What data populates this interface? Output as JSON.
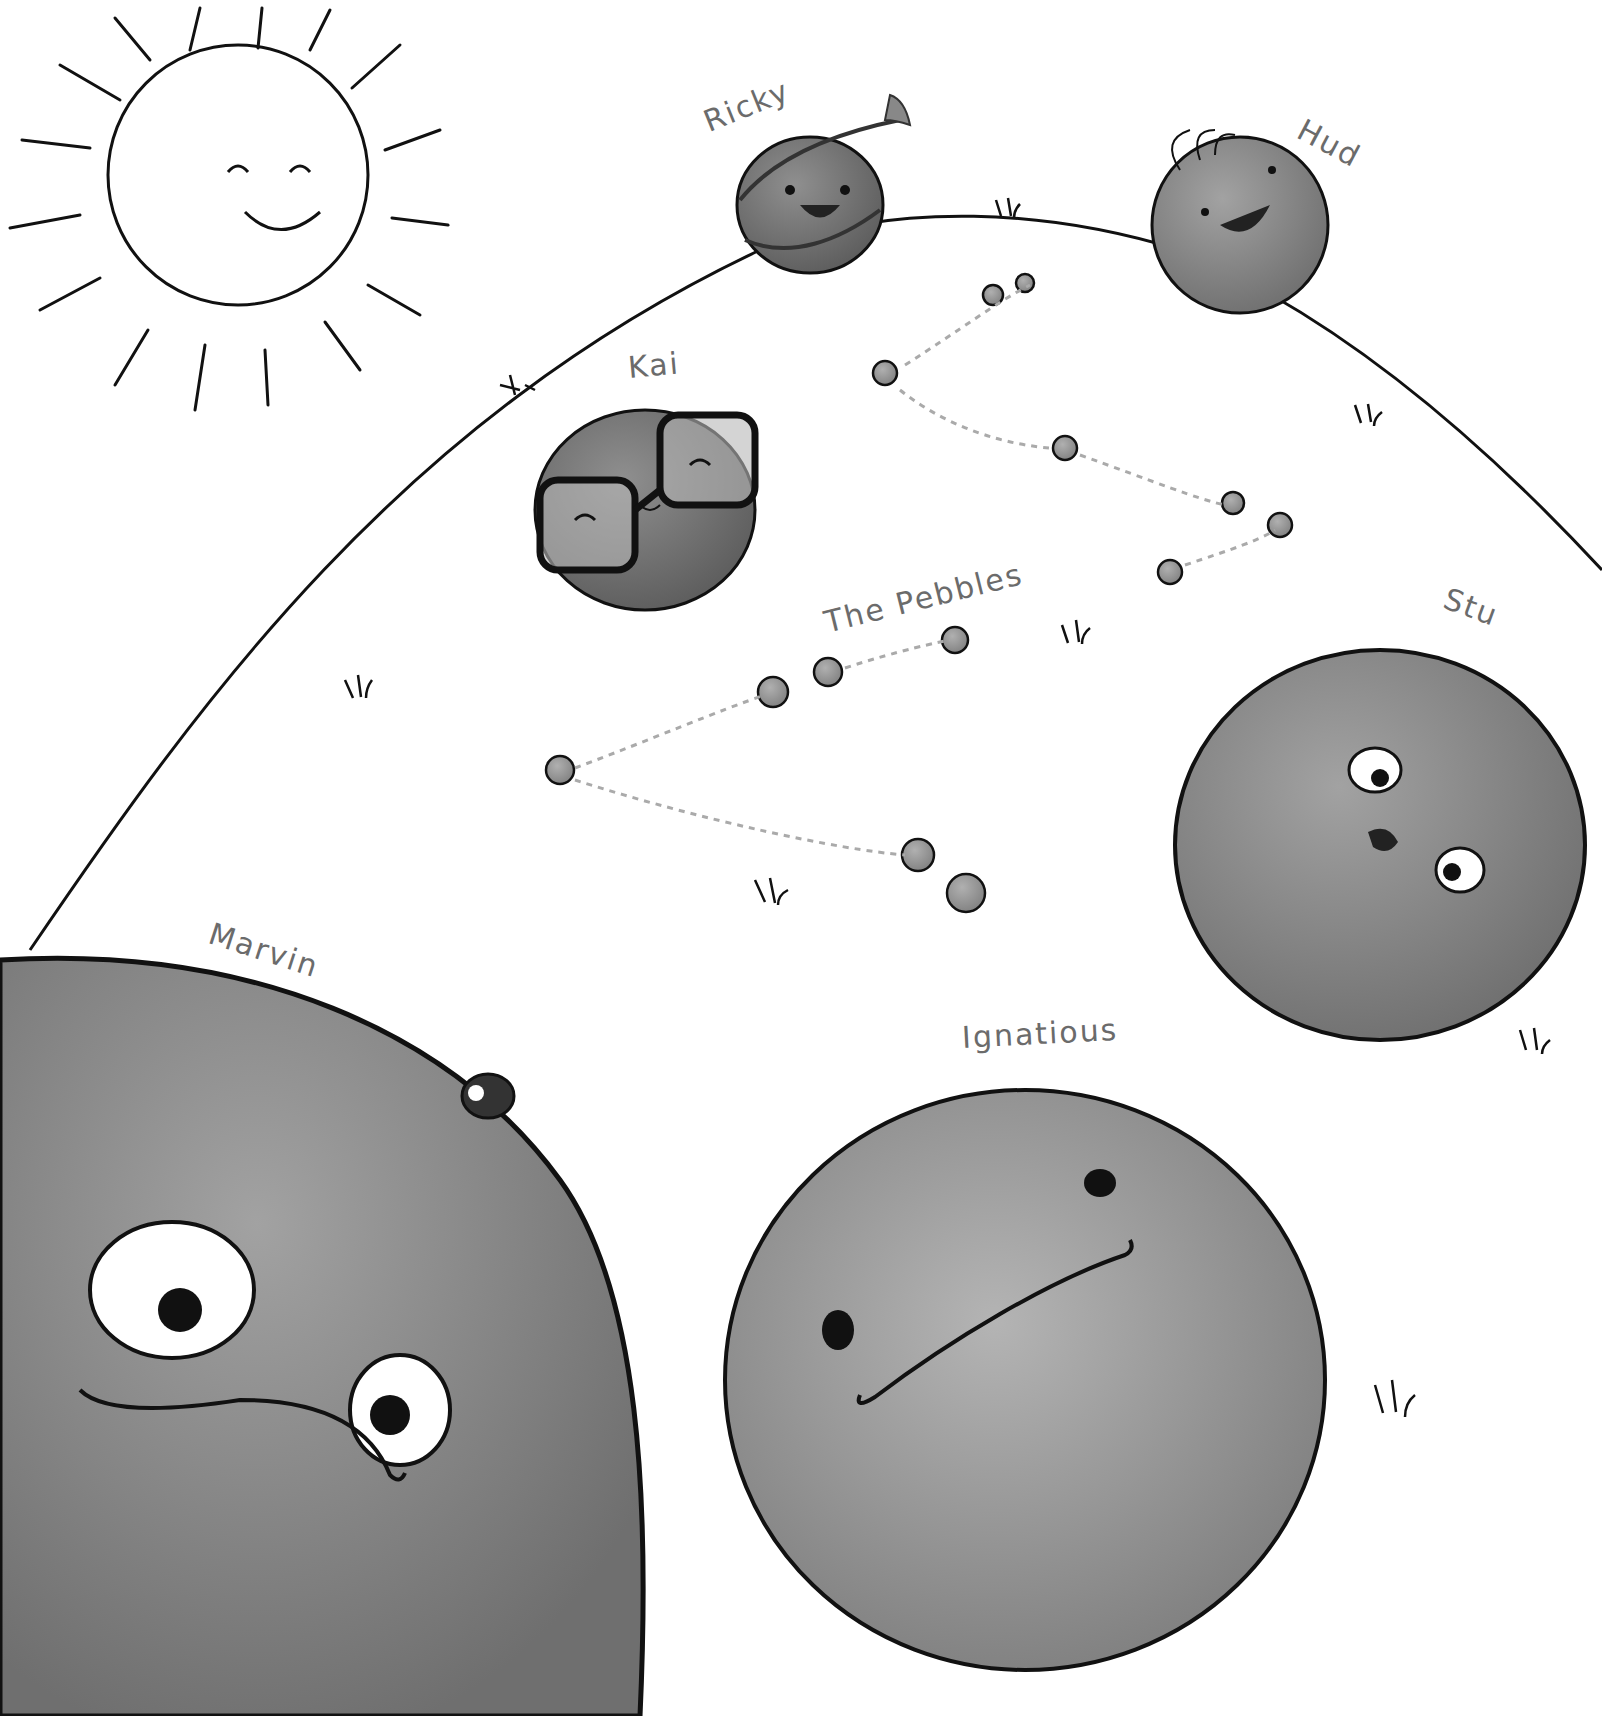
{
  "illustration": {
    "description": "Hand-drawn grayscale illustration of smiling rock characters on a hill with a sun",
    "labels": {
      "ricky": "Ricky",
      "hud": "Hud",
      "kai": "Kai",
      "pebbles": "The Pebbles",
      "stu": "Stu",
      "marvin": "Marvin",
      "ignatious": "Ignatious"
    },
    "colors": {
      "background": "#ffffff",
      "outline": "#111111",
      "label_text": "#6b6b6b",
      "rock_dark": "#6e6e6e",
      "rock_mid": "#8a8a8a",
      "rock_light": "#9d9d9d",
      "sun_fill": "#ffffff"
    }
  }
}
